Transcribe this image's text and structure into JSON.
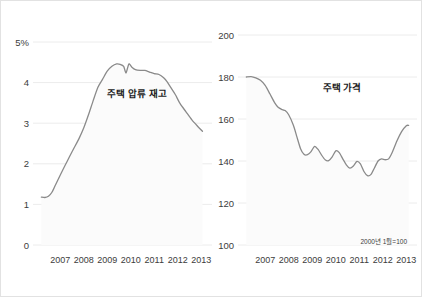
{
  "figure": {
    "background_color": "#ffffff",
    "border_color": "#e2e2e2",
    "line_color": "#8a8a8a",
    "grid_color": "#ececec"
  },
  "chart_data": [
    {
      "type": "line",
      "panel": "left",
      "title": "주택 압류 재고",
      "xlabel": "",
      "ylabel": "",
      "xlim": [
        2006.6,
        2013.7
      ],
      "ylim": [
        0,
        5
      ],
      "grid": true,
      "legend": "none",
      "ytick_labels": [
        "5%",
        "4",
        "3",
        "2",
        "1",
        "0"
      ],
      "ytick_values": [
        5,
        4,
        3,
        2,
        1,
        0
      ],
      "xtick_labels": [
        "2007",
        "2008",
        "2009",
        "2010",
        "2011",
        "2012",
        "2013"
      ],
      "xtick_values": [
        2007,
        2008,
        2009,
        2010,
        2011,
        2012,
        2013
      ],
      "x": [
        2006.7,
        2006.85,
        2007.0,
        2007.15,
        2007.3,
        2007.5,
        2007.7,
        2007.9,
        2008.1,
        2008.3,
        2008.5,
        2008.7,
        2008.9,
        2009.1,
        2009.3,
        2009.5,
        2009.7,
        2009.9,
        2010.05,
        2010.2,
        2010.3,
        2010.42,
        2010.55,
        2010.7,
        2010.9,
        2011.1,
        2011.3,
        2011.5,
        2011.7,
        2011.9,
        2012.05,
        2012.2,
        2012.4,
        2012.6,
        2012.85,
        2013.1,
        2013.35,
        2013.55
      ],
      "values": [
        1.18,
        1.17,
        1.2,
        1.3,
        1.48,
        1.72,
        1.95,
        2.18,
        2.4,
        2.62,
        2.88,
        3.2,
        3.55,
        3.88,
        4.08,
        4.28,
        4.4,
        4.46,
        4.45,
        4.4,
        4.24,
        4.46,
        4.38,
        4.32,
        4.3,
        4.3,
        4.26,
        4.22,
        4.2,
        4.12,
        4.02,
        3.88,
        3.7,
        3.48,
        3.28,
        3.08,
        2.92,
        2.8
      ]
    },
    {
      "type": "line",
      "panel": "right",
      "title": "주택 가격",
      "xlabel": "",
      "ylabel": "",
      "annotation": "2000년 1월=100",
      "xlim": [
        2006.6,
        2013.7
      ],
      "ylim": [
        100,
        200
      ],
      "grid": true,
      "legend": "none",
      "ytick_labels": [
        "200",
        "180",
        "160",
        "140",
        "120",
        "100"
      ],
      "ytick_values": [
        200,
        180,
        160,
        140,
        120,
        100
      ],
      "xtick_labels": [
        "2007",
        "2008",
        "2009",
        "2010",
        "2011",
        "2012",
        "2013"
      ],
      "xtick_values": [
        2007,
        2008,
        2009,
        2010,
        2011,
        2012,
        2013
      ],
      "x": [
        2006.7,
        2006.9,
        2007.1,
        2007.3,
        2007.5,
        2007.7,
        2007.9,
        2008.05,
        2008.2,
        2008.35,
        2008.5,
        2008.7,
        2008.85,
        2009.0,
        2009.15,
        2009.3,
        2009.45,
        2009.6,
        2009.75,
        2009.9,
        2010.05,
        2010.2,
        2010.35,
        2010.5,
        2010.65,
        2010.8,
        2010.95,
        2011.1,
        2011.25,
        2011.4,
        2011.55,
        2011.7,
        2011.85,
        2012.0,
        2012.15,
        2012.3,
        2012.45,
        2012.6,
        2012.75,
        2012.9,
        2013.1,
        2013.3,
        2013.5,
        2013.6
      ],
      "values": [
        180.0,
        180.2,
        179.6,
        178.4,
        176.0,
        172.0,
        167.8,
        165.6,
        164.6,
        164.0,
        162.0,
        157.0,
        151.5,
        146.0,
        143.2,
        143.0,
        144.5,
        147.0,
        145.5,
        142.8,
        140.6,
        140.2,
        142.0,
        144.8,
        144.0,
        141.0,
        138.2,
        136.6,
        137.6,
        139.8,
        138.6,
        135.0,
        133.0,
        133.6,
        136.8,
        140.0,
        141.0,
        140.6,
        141.0,
        144.0,
        149.5,
        154.0,
        156.8,
        157.0
      ]
    }
  ]
}
